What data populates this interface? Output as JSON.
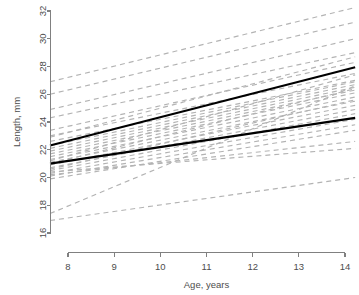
{
  "chart_data": {
    "type": "line",
    "title": "",
    "subtitle": "",
    "xlabel": "Age, years",
    "ylabel": "Length, mm",
    "xlim": [
      7.6,
      14.25
    ],
    "ylim": [
      16,
      32
    ],
    "xticks": [
      8,
      9,
      10,
      11,
      12,
      13,
      14
    ],
    "xtick_labels": [
      "8",
      "9",
      "10",
      "11",
      "12",
      "13",
      "14"
    ],
    "yticks": [
      16,
      18,
      20,
      22,
      24,
      26,
      28,
      30,
      32
    ],
    "ytick_labels": [
      "16",
      "18",
      "20",
      "22",
      "24",
      "26",
      "28",
      "30",
      "32"
    ],
    "grid": false,
    "legend": "none",
    "colors": {
      "subject_line": "#b3b3b3",
      "fit_line": "#000000",
      "axis": "#808080",
      "text": "#4d4d4d",
      "background": "#ffffff"
    },
    "series": [
      {
        "name": "Fitted line 1 (upper)",
        "style": "solid",
        "color": "#000000",
        "x": [
          7.61,
          14.22
        ],
        "values": [
          22.3,
          27.95
        ]
      },
      {
        "name": "Fitted line 2 (lower)",
        "style": "solid",
        "color": "#000000",
        "x": [
          7.61,
          14.22
        ],
        "values": [
          21.0,
          24.3
        ]
      },
      {
        "name": "Subject 01",
        "style": "dashed",
        "color": "#b3b3b3",
        "x": [
          7.61,
          14.22
        ],
        "values": [
          26.9,
          32.25
        ]
      },
      {
        "name": "Subject 02",
        "style": "dashed",
        "color": "#b3b3b3",
        "x": [
          7.61,
          14.22
        ],
        "values": [
          26.0,
          31.2
        ]
      },
      {
        "name": "Subject 03",
        "style": "dashed",
        "color": "#b3b3b3",
        "x": [
          7.61,
          14.22
        ],
        "values": [
          24.9,
          30.0
        ]
      },
      {
        "name": "Subject 04",
        "style": "dashed",
        "color": "#b3b3b3",
        "x": [
          7.61,
          14.22
        ],
        "values": [
          24.3,
          29.0
        ]
      },
      {
        "name": "Subject 05",
        "style": "dashed",
        "color": "#b3b3b3",
        "x": [
          7.61,
          14.22
        ],
        "values": [
          23.4,
          28.3
        ]
      },
      {
        "name": "Subject 06",
        "style": "dashed",
        "color": "#b3b3b3",
        "x": [
          7.61,
          14.22
        ],
        "values": [
          23.0,
          27.5
        ]
      },
      {
        "name": "Subject 07",
        "style": "dashed",
        "color": "#b3b3b3",
        "x": [
          7.61,
          14.22
        ],
        "values": [
          22.6,
          27.0
        ]
      },
      {
        "name": "Subject 08",
        "style": "dashed",
        "color": "#b3b3b3",
        "x": [
          7.61,
          14.22
        ],
        "values": [
          22.3,
          26.9
        ]
      },
      {
        "name": "Subject 09",
        "style": "dashed",
        "color": "#b3b3b3",
        "x": [
          7.61,
          14.22
        ],
        "values": [
          22.1,
          26.7
        ]
      },
      {
        "name": "Subject 10",
        "style": "dashed",
        "color": "#b3b3b3",
        "x": [
          7.61,
          14.22
        ],
        "values": [
          21.9,
          26.5
        ]
      },
      {
        "name": "Subject 11",
        "style": "dashed",
        "color": "#b3b3b3",
        "x": [
          7.61,
          14.22
        ],
        "values": [
          21.7,
          26.3
        ]
      },
      {
        "name": "Subject 12",
        "style": "dashed",
        "color": "#b3b3b3",
        "x": [
          7.61,
          14.22
        ],
        "values": [
          21.5,
          26.1
        ]
      },
      {
        "name": "Subject 13",
        "style": "dashed",
        "color": "#b3b3b3",
        "x": [
          7.61,
          14.22
        ],
        "values": [
          21.3,
          25.8
        ]
      },
      {
        "name": "Subject 14",
        "style": "dashed",
        "color": "#b3b3b3",
        "x": [
          7.61,
          14.22
        ],
        "values": [
          21.1,
          25.5
        ]
      },
      {
        "name": "Subject 15",
        "style": "dashed",
        "color": "#b3b3b3",
        "x": [
          7.61,
          14.22
        ],
        "values": [
          20.9,
          25.2
        ]
      },
      {
        "name": "Subject 16",
        "style": "dashed",
        "color": "#b3b3b3",
        "x": [
          7.61,
          14.22
        ],
        "values": [
          20.7,
          24.9
        ]
      },
      {
        "name": "Subject 17",
        "style": "dashed",
        "color": "#b3b3b3",
        "x": [
          7.61,
          14.22
        ],
        "values": [
          20.5,
          24.6
        ]
      },
      {
        "name": "Subject 18",
        "style": "dashed",
        "color": "#b3b3b3",
        "x": [
          7.61,
          14.22
        ],
        "values": [
          20.3,
          24.2
        ]
      },
      {
        "name": "Subject 19",
        "style": "dashed",
        "color": "#b3b3b3",
        "x": [
          7.61,
          14.22
        ],
        "values": [
          20.1,
          23.8
        ]
      },
      {
        "name": "Subject 20",
        "style": "dashed",
        "color": "#b3b3b3",
        "x": [
          7.61,
          14.22
        ],
        "values": [
          19.9,
          23.4
        ]
      },
      {
        "name": "Subject 21",
        "style": "dashed",
        "color": "#b3b3b3",
        "x": [
          7.61,
          14.22
        ],
        "values": [
          21.0,
          26.4
        ]
      },
      {
        "name": "Subject 22",
        "style": "dashed",
        "color": "#b3b3b3",
        "x": [
          7.61,
          14.22
        ],
        "values": [
          20.6,
          25.6
        ]
      },
      {
        "name": "Subject 23",
        "style": "dashed",
        "color": "#b3b3b3",
        "x": [
          7.61,
          14.22
        ],
        "values": [
          20.2,
          22.6
        ]
      },
      {
        "name": "Subject 24",
        "style": "dashed",
        "color": "#b3b3b3",
        "x": [
          7.61,
          14.22
        ],
        "values": [
          20.4,
          22.1
        ]
      },
      {
        "name": "Subject 25",
        "style": "dashed",
        "color": "#b3b3b3",
        "x": [
          7.61,
          14.22
        ],
        "values": [
          17.4,
          26.6
        ]
      },
      {
        "name": "Subject 26",
        "style": "dashed",
        "color": "#b3b3b3",
        "x": [
          7.61,
          14.22
        ],
        "values": [
          16.9,
          20.0
        ]
      },
      {
        "name": "Subject 27",
        "style": "dashed",
        "color": "#b3b3b3",
        "x": [
          7.61,
          14.22
        ],
        "values": [
          22.9,
          28.7
        ]
      },
      {
        "name": "Subject 28",
        "style": "dashed",
        "color": "#b3b3b3",
        "x": [
          7.61,
          14.22
        ],
        "values": [
          21.2,
          27.4
        ]
      }
    ]
  }
}
